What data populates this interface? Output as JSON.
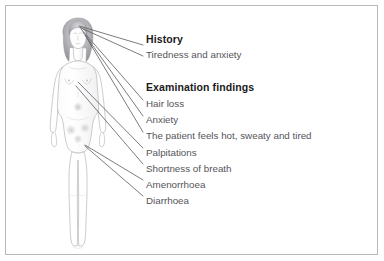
{
  "figure": {
    "alt_name": "standing-female-figure-line-drawing",
    "outline_color": "#b0b0b4",
    "hair_color": "#9a9a9e",
    "shading_color": "#d8d8dc"
  },
  "pointer_lines": {
    "color": "#5a5a60",
    "width": 0.8,
    "count": 9
  },
  "history": {
    "heading": "History",
    "items": [
      "Tiredness and anxiety"
    ]
  },
  "examination": {
    "heading": "Examination findings",
    "items": [
      "Hair loss",
      "Anxiety",
      "The patient feels hot, sweaty and tired",
      "Palpitations",
      "Shortness of breath",
      "Amenorrhoea",
      "Diarrhoea"
    ]
  },
  "colors": {
    "border": "#b9b9b9",
    "heading_text": "#1a1a1a",
    "body_text": "#55555a",
    "background": "#ffffff"
  }
}
